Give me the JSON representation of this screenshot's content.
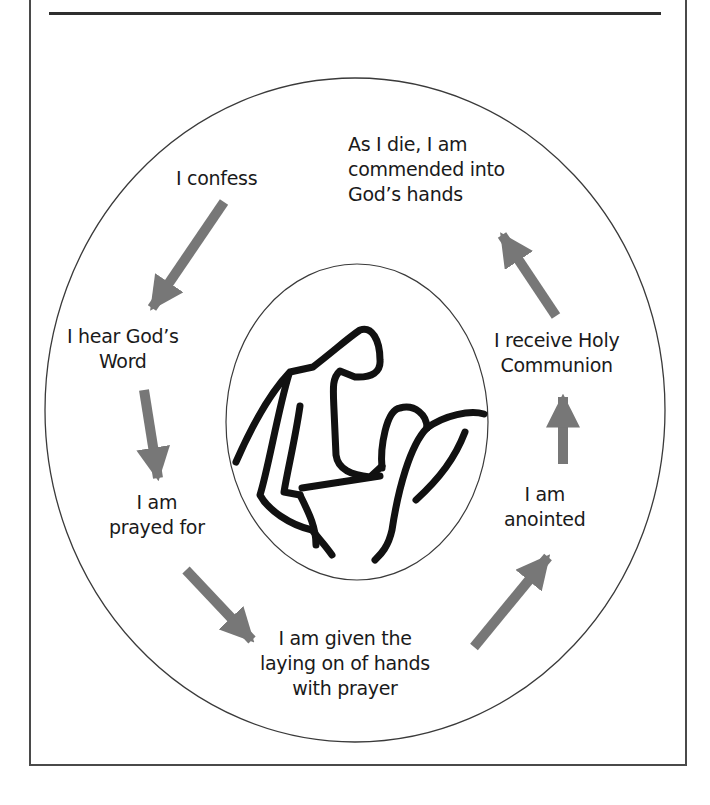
{
  "diagram": {
    "title": "",
    "center_illustration": "figure-comforting-person-in-bed",
    "arrow_color": "#777777",
    "line_color": "#3a3a3a",
    "steps": [
      {
        "id": "confess",
        "lines": [
          "I confess"
        ]
      },
      {
        "id": "hear-word",
        "lines": [
          "I hear God’s",
          "Word"
        ]
      },
      {
        "id": "prayed-for",
        "lines": [
          "I am",
          "prayed for"
        ]
      },
      {
        "id": "laying-on-hands",
        "lines": [
          "I am given the",
          "laying on of hands",
          "with prayer"
        ]
      },
      {
        "id": "anointed",
        "lines": [
          "I am",
          "anointed"
        ]
      },
      {
        "id": "holy-communion",
        "lines": [
          "I receive Holy",
          "Communion"
        ]
      },
      {
        "id": "commended",
        "lines": [
          "As I die, I am",
          "commended into",
          "God’s hands"
        ]
      }
    ]
  }
}
